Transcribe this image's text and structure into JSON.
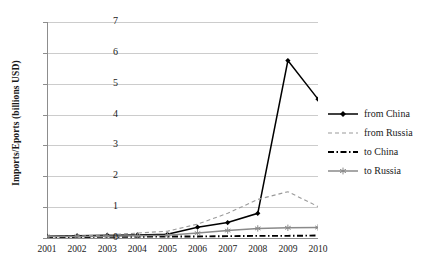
{
  "chart_data": {
    "type": "line",
    "title": "",
    "xlabel": "",
    "ylabel": "Imports/Eports (billions USD)",
    "categories": [
      "2001",
      "2002",
      "2003",
      "2004",
      "2005",
      "2006",
      "2007",
      "2008",
      "2009",
      "2010"
    ],
    "ylim": [
      0,
      7
    ],
    "ytick_labels": [
      "0",
      "1",
      "2",
      "3",
      "4",
      "5",
      "6",
      "7"
    ],
    "grid": "horizontal",
    "legend_position": "right",
    "series": [
      {
        "name": "from China",
        "style": "solid",
        "color": "#000000",
        "marker": "diamond",
        "values": [
          0.06,
          0.07,
          0.09,
          0.1,
          0.12,
          0.35,
          0.5,
          0.8,
          5.75,
          4.5
        ]
      },
      {
        "name": "from Russia",
        "style": "dashed",
        "color": "#9a9a9a",
        "marker": "none",
        "values": [
          0.04,
          0.06,
          0.1,
          0.16,
          0.22,
          0.45,
          0.8,
          1.25,
          1.5,
          1.02
        ]
      },
      {
        "name": "to China",
        "style": "dash-dot",
        "color": "#000000",
        "marker": "none",
        "values": [
          0.03,
          0.03,
          0.04,
          0.04,
          0.05,
          0.05,
          0.06,
          0.07,
          0.07,
          0.08
        ]
      },
      {
        "name": "to Russia",
        "style": "solid",
        "color": "#8a8a8a",
        "marker": "asterisk",
        "values": [
          0.05,
          0.05,
          0.06,
          0.07,
          0.09,
          0.16,
          0.24,
          0.31,
          0.33,
          0.34
        ]
      }
    ]
  }
}
